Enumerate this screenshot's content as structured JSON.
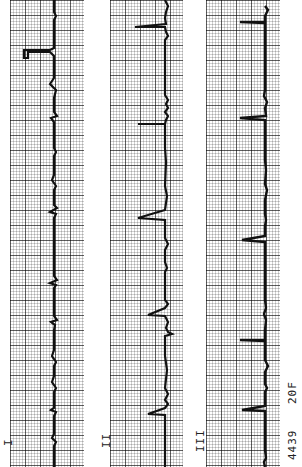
{
  "leads": [
    {
      "label": "I",
      "strip_left": 10,
      "strip_width": 74,
      "baseline_x": 54
    },
    {
      "label": "II",
      "strip_left": 110,
      "strip_width": 73,
      "baseline_x": 165
    },
    {
      "label": "III",
      "strip_left": 206,
      "strip_width": 74,
      "baseline_x": 265
    }
  ],
  "annotation": {
    "record_id": "4439",
    "patient": "20F"
  },
  "colors": {
    "trace": "#111111",
    "grid_major": "#6b6b6b",
    "grid_minor": "#cfcfcf",
    "paper": "#ffffff"
  }
}
